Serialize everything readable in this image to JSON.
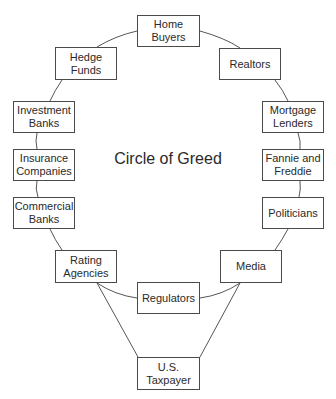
{
  "diagram": {
    "title": "Circle of Greed",
    "line_color": "#555555",
    "nodes": [
      {
        "id": "home-buyers",
        "label": "Home\nBuyers",
        "x": 137,
        "y": 15,
        "w": 63,
        "h": 32
      },
      {
        "id": "realtors",
        "label": "Realtors",
        "x": 219,
        "y": 48,
        "w": 62,
        "h": 32
      },
      {
        "id": "mortgage-lenders",
        "label": "Mortgage\nLenders",
        "x": 262,
        "y": 101,
        "w": 62,
        "h": 32
      },
      {
        "id": "fannie-and-freddie",
        "label": "Fannie and\nFreddie",
        "x": 262,
        "y": 149,
        "w": 62,
        "h": 32
      },
      {
        "id": "politicians",
        "label": "Politicians",
        "x": 262,
        "y": 197,
        "w": 62,
        "h": 32
      },
      {
        "id": "media",
        "label": "Media",
        "x": 220,
        "y": 250,
        "w": 62,
        "h": 33
      },
      {
        "id": "regulators",
        "label": "Regulators",
        "x": 137,
        "y": 282,
        "w": 63,
        "h": 32
      },
      {
        "id": "rating-agencies",
        "label": "Rating\nAgencies",
        "x": 55,
        "y": 250,
        "w": 62,
        "h": 33
      },
      {
        "id": "commercial-banks",
        "label": "Commercial\nBanks",
        "x": 13,
        "y": 197,
        "w": 62,
        "h": 32
      },
      {
        "id": "insurance-companies",
        "label": "Insurance\nCompanies",
        "x": 13,
        "y": 149,
        "w": 62,
        "h": 32
      },
      {
        "id": "investment-banks",
        "label": "Investment\nBanks",
        "x": 13,
        "y": 101,
        "w": 62,
        "h": 32
      },
      {
        "id": "hedge-funds",
        "label": "Hedge\nFunds",
        "x": 55,
        "y": 47,
        "w": 62,
        "h": 33
      },
      {
        "id": "us-taxpayer",
        "label": "U.S.\nTaxpayer",
        "x": 137,
        "y": 357,
        "w": 63,
        "h": 33
      }
    ],
    "edges": [
      [
        "home-buyers",
        "realtors"
      ],
      [
        "realtors",
        "mortgage-lenders"
      ],
      [
        "mortgage-lenders",
        "fannie-and-freddie"
      ],
      [
        "fannie-and-freddie",
        "politicians"
      ],
      [
        "politicians",
        "media"
      ],
      [
        "media",
        "regulators"
      ],
      [
        "regulators",
        "rating-agencies"
      ],
      [
        "rating-agencies",
        "commercial-banks"
      ],
      [
        "commercial-banks",
        "insurance-companies"
      ],
      [
        "insurance-companies",
        "investment-banks"
      ],
      [
        "investment-banks",
        "hedge-funds"
      ],
      [
        "hedge-funds",
        "home-buyers"
      ],
      [
        "rating-agencies",
        "us-taxpayer"
      ],
      [
        "media",
        "us-taxpayer"
      ]
    ]
  }
}
